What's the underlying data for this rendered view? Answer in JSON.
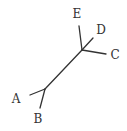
{
  "diagram": {
    "type": "unrooted-phylogenetic-tree",
    "internal_nodes": [
      {
        "id": "n1",
        "x": 45,
        "y": 89
      },
      {
        "id": "n2",
        "x": 82,
        "y": 50
      }
    ],
    "edges": [
      {
        "id": "internal",
        "from": "n1",
        "to": "n2",
        "x1": 45,
        "y1": 89,
        "x2": 82,
        "y2": 50
      },
      {
        "id": "edge-A",
        "leaf": "A",
        "x1": 45,
        "y1": 89,
        "x2": 30,
        "y2": 95
      },
      {
        "id": "edge-B",
        "leaf": "B",
        "x1": 45,
        "y1": 89,
        "x2": 40,
        "y2": 108
      },
      {
        "id": "edge-C",
        "leaf": "C",
        "x1": 82,
        "y1": 50,
        "x2": 106,
        "y2": 54
      },
      {
        "id": "edge-D",
        "leaf": "D",
        "x1": 82,
        "y1": 50,
        "x2": 93,
        "y2": 38
      },
      {
        "id": "edge-E",
        "leaf": "E",
        "x1": 82,
        "y1": 50,
        "x2": 79,
        "y2": 26
      }
    ],
    "leaves": [
      {
        "label": "A",
        "x": 16,
        "y": 99
      },
      {
        "label": "B",
        "x": 38,
        "y": 119
      },
      {
        "label": "C",
        "x": 115,
        "y": 55
      },
      {
        "label": "D",
        "x": 101,
        "y": 30
      },
      {
        "label": "E",
        "x": 77,
        "y": 14
      }
    ],
    "colors": {
      "line": "#333333",
      "text": "#333333",
      "background": "#ffffff"
    }
  }
}
